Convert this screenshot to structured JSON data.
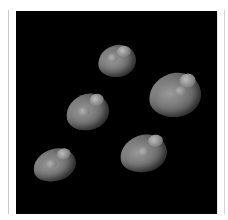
{
  "image": {
    "description": "Five grayscale 3D-rendered shell (foraminifera-like) specimens on a black background",
    "background_color": "#000000",
    "specimens": [
      {
        "id": 1,
        "label": "top-center"
      },
      {
        "id": 2,
        "label": "right-large"
      },
      {
        "id": 3,
        "label": "middle-left"
      },
      {
        "id": 4,
        "label": "bottom-right"
      },
      {
        "id": 5,
        "label": "bottom-left"
      }
    ]
  }
}
